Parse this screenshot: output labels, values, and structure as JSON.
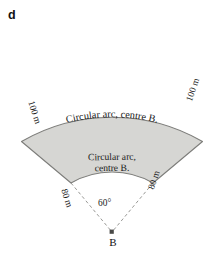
{
  "figure": {
    "part_label": "d",
    "outer_arc_label": "Circular arc, centre B.",
    "inner_arc_label_line1": "Circular arc,",
    "inner_arc_label_line2": "centre B.",
    "outer_radius_label_left": "100 m",
    "outer_radius_label_right": "100 m",
    "inner_radius_label_left": "80 m",
    "inner_radius_label_right": "80 m",
    "angle_label": "60°",
    "centre_point_label": "B"
  },
  "geometry": {
    "centre_x": 112,
    "centre_y": 232,
    "inner_radius_px": 82,
    "outer_radius_px": 181,
    "sweep_degrees": 60,
    "start_angle_degrees": -120,
    "end_angle_degrees": -60
  },
  "colors": {
    "shade_fill": "#d6d6d3",
    "shade_stroke": "#7d7d7a",
    "dashed_stroke": "#8c8c89",
    "text": "#1a1a1a",
    "background": "#ffffff"
  }
}
